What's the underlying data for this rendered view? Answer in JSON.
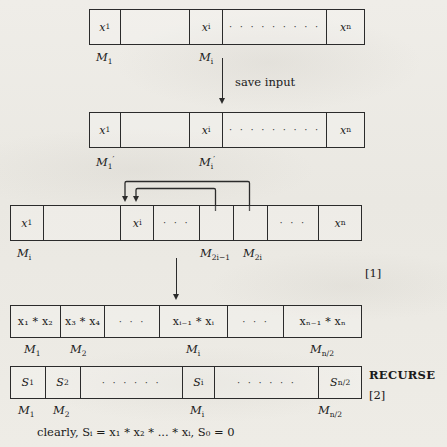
{
  "figure": {
    "caption": "clearly, Sᵢ = x₁ * x₂ * ... * xᵢ, S₀ = 0",
    "step_tags": {
      "one": "[1]",
      "two": "[2]",
      "recurse": "RECURSE"
    },
    "save_input_label": "save input"
  },
  "arrays": [
    {
      "id": "input-array",
      "cells": [
        {
          "text": "x",
          "sub": "1"
        },
        {
          "text": ""
        },
        {
          "text": "x",
          "sub": "i"
        },
        {
          "text": "· · · · · · · · ·"
        },
        {
          "text": "x",
          "sub": "n"
        }
      ],
      "labels": [
        {
          "text": "M",
          "sub": "1"
        },
        {
          "text": "M",
          "sub": "i"
        }
      ]
    },
    {
      "id": "saved-input-array",
      "cells": [
        {
          "text": "x",
          "sub": "1"
        },
        {
          "text": ""
        },
        {
          "text": "x",
          "sub": "i"
        },
        {
          "text": "· · · · · · · · ·"
        },
        {
          "text": "x",
          "sub": "n"
        }
      ],
      "labels": [
        {
          "text": "M",
          "sub": "1",
          "prime": "′"
        },
        {
          "text": "M",
          "sub": "i",
          "prime": "′"
        }
      ]
    },
    {
      "id": "expanded-array",
      "cells": [
        {
          "text": "x",
          "sub": "1"
        },
        {
          "text": ""
        },
        {
          "text": "x",
          "sub": "i"
        },
        {
          "text": "· · ·"
        },
        {
          "text": ""
        },
        {
          "text": ""
        },
        {
          "text": "· · ·"
        },
        {
          "text": "x",
          "sub": "n"
        }
      ],
      "labels": [
        {
          "text": "M",
          "sub": "i"
        },
        {
          "text": "M",
          "sub": "2i−1"
        },
        {
          "text": "M",
          "sub": "2i"
        }
      ]
    },
    {
      "id": "pairwise-product-array",
      "cells": [
        {
          "text": "x₁ * x₂"
        },
        {
          "text": "x₃ * x₄"
        },
        {
          "text": "· · ·"
        },
        {
          "text": "xᵢ₋₁ * xᵢ"
        },
        {
          "text": "· · ·"
        },
        {
          "text": "xₙ₋₁ * xₙ"
        }
      ],
      "labels": [
        {
          "text": "M",
          "sub": "1"
        },
        {
          "text": "M",
          "sub": "2"
        },
        {
          "text": "M",
          "sub": "i"
        },
        {
          "text": "M",
          "sub": "n/2"
        }
      ]
    },
    {
      "id": "prefix-sum-array",
      "cells": [
        {
          "text": "S",
          "sub": "1"
        },
        {
          "text": "S",
          "sub": "2"
        },
        {
          "text": "· · · · · ·"
        },
        {
          "text": "S",
          "sub": "i"
        },
        {
          "text": "· · · · · ·"
        },
        {
          "text": "S",
          "sub": "n/2"
        }
      ],
      "labels": [
        {
          "text": "M",
          "sub": "1"
        },
        {
          "text": "M",
          "sub": "2"
        },
        {
          "text": "M",
          "sub": "i"
        },
        {
          "text": "M",
          "sub": "n/2"
        }
      ]
    }
  ],
  "colors": {
    "ink": "#2b2b2b",
    "paper": "#eceae4"
  }
}
